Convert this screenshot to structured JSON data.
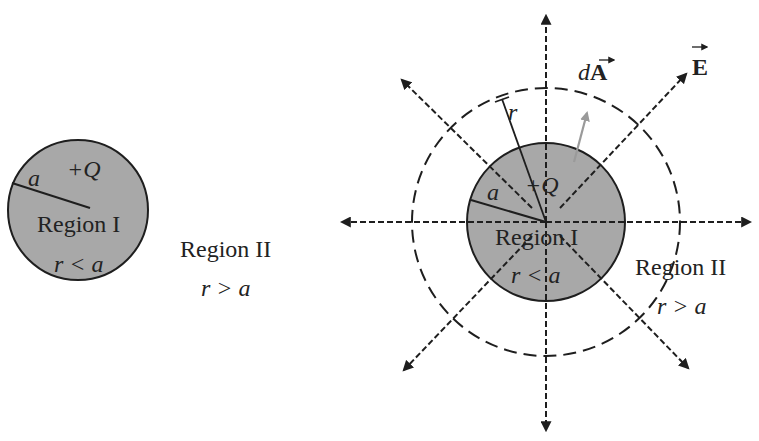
{
  "left_figure": {
    "radius_label": "a",
    "charge_label": "+Q",
    "inner_region_label": "Region I",
    "inner_condition": "r < a",
    "outer_region_label": "Region II",
    "outer_condition": "r > a"
  },
  "right_figure": {
    "radius_label": "a",
    "gaussian_radius_label": "r",
    "charge_label": "+Q",
    "inner_region_label": "Region I",
    "inner_condition": "r < a",
    "outer_region_label": "Region II",
    "outer_condition": "r > a",
    "area_vector_label": "dA",
    "field_vector_label": "E",
    "field_line_count": 8
  },
  "colors": {
    "sphere_fill": "#a8a8a8",
    "line": "#1e1e1e",
    "area_vector": "#9a9a9a",
    "background": "#ffffff"
  }
}
